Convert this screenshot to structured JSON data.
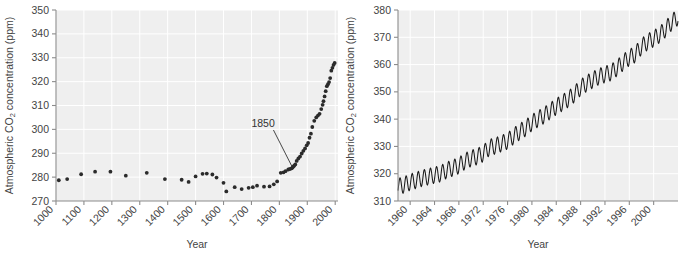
{
  "figure": {
    "name": "atmospheric-co2-concentration-figure",
    "background_color": "#ffffff",
    "plot_background_color": "#efefef",
    "gridline_color": "#ffffff",
    "axis_color": "#8c8c8c",
    "marker_color": "#2b2b2b",
    "line_color": "#1a1a1a",
    "text_color": "#444444"
  },
  "chart_data": [
    {
      "id": "left",
      "type": "scatter",
      "title": "",
      "xlabel": "Year",
      "ylabel": "Atmospheric CO2 concentration (ppm)",
      "ylabel_parts": {
        "pre": "Atmospheric CO",
        "sub": "2",
        "post": " concentration (ppm)"
      },
      "xlim": [
        1000,
        2010
      ],
      "ylim": [
        270,
        350
      ],
      "xticks": [
        1000,
        1100,
        1200,
        1300,
        1400,
        1500,
        1600,
        1700,
        1800,
        1900,
        2000
      ],
      "xtick_labels": [
        "1000",
        "1100",
        "1200",
        "1300",
        "1400",
        "1500",
        "1600",
        "1700",
        "1800",
        "1900",
        "2000"
      ],
      "xtick_label_rotation": -45,
      "yticks": [
        270,
        280,
        290,
        300,
        310,
        320,
        330,
        340,
        350
      ],
      "ytick_labels": [
        "270",
        "280",
        "290",
        "300",
        "310",
        "320",
        "330",
        "340",
        "350"
      ],
      "grid": true,
      "legend": "none",
      "annotations": [
        {
          "text": "1850",
          "label_x": 1700,
          "label_y": 301,
          "point_x": 1845,
          "point_y": 284.5
        }
      ],
      "x": [
        1010,
        1040,
        1090,
        1140,
        1195,
        1250,
        1325,
        1390,
        1450,
        1475,
        1500,
        1525,
        1540,
        1560,
        1575,
        1600,
        1610,
        1640,
        1665,
        1690,
        1705,
        1720,
        1745,
        1765,
        1780,
        1792,
        1805,
        1815,
        1822,
        1832,
        1838,
        1844,
        1847,
        1850,
        1853,
        1857,
        1862,
        1868,
        1874,
        1880,
        1886,
        1892,
        1898,
        1903,
        1908,
        1913,
        1918,
        1925,
        1932,
        1938,
        1944,
        1950,
        1955,
        1958,
        1962,
        1966,
        1970,
        1974,
        1978,
        1982,
        1986,
        1990,
        1994,
        1998
      ],
      "y": [
        278.7,
        279.2,
        281.2,
        282.3,
        282.3,
        280.6,
        281.8,
        279.2,
        278.9,
        278.0,
        280.3,
        281.4,
        281.5,
        281.1,
        279.8,
        277.6,
        274.0,
        275.8,
        275.0,
        275.5,
        275.8,
        276.4,
        276.0,
        276.1,
        277.0,
        278.2,
        281.8,
        282.0,
        282.5,
        283.2,
        283.4,
        283.7,
        284.0,
        284.4,
        284.8,
        285.3,
        286.8,
        287.8,
        288.6,
        289.9,
        291.0,
        292.0,
        293.3,
        294.3,
        296.5,
        298.2,
        301.0,
        303.6,
        305.0,
        305.8,
        306.5,
        308.5,
        310.3,
        311.8,
        313.8,
        316.0,
        318.1,
        318.9,
        319.8,
        321.5,
        324.6,
        325.8,
        327.0,
        327.8
      ]
    },
    {
      "id": "right",
      "type": "line",
      "title": "",
      "xlabel": "Year",
      "ylabel": "Atmospheric CO2 concentration (ppm)",
      "ylabel_parts": {
        "pre": "Atmospheric CO",
        "sub": "2",
        "post": " concentration (ppm)"
      },
      "xlim": [
        1958.0,
        2004.0
      ],
      "ylim": [
        310,
        380
      ],
      "xticks": [
        1960,
        1964,
        1968,
        1972,
        1976,
        1980,
        1984,
        1988,
        1992,
        1996,
        2000
      ],
      "xtick_labels": [
        "1960",
        "1964",
        "1968",
        "1972",
        "1976",
        "1980",
        "1984",
        "1988",
        "1992",
        "1996",
        "2000"
      ],
      "xtick_label_rotation": -45,
      "yticks": [
        310,
        320,
        330,
        340,
        350,
        360,
        370,
        380
      ],
      "ytick_labels": [
        "310",
        "320",
        "330",
        "340",
        "350",
        "360",
        "370",
        "380"
      ],
      "grid": true,
      "legend": "none",
      "series_name": "Mauna Loa monthly mean CO2",
      "seasonal_amplitude_ppm": 3.0,
      "annual_means": {
        "years": [
          1958,
          1959,
          1960,
          1961,
          1962,
          1963,
          1964,
          1965,
          1966,
          1967,
          1968,
          1969,
          1970,
          1971,
          1972,
          1973,
          1974,
          1975,
          1976,
          1977,
          1978,
          1979,
          1980,
          1981,
          1982,
          1983,
          1984,
          1985,
          1986,
          1987,
          1988,
          1989,
          1990,
          1991,
          1992,
          1993,
          1994,
          1995,
          1996,
          1997,
          1998,
          1999,
          2000,
          2001,
          2002,
          2003,
          2004
        ],
        "values": [
          315.3,
          315.9,
          316.9,
          317.6,
          318.4,
          318.9,
          319.5,
          320.0,
          321.3,
          322.1,
          323.0,
          324.6,
          325.6,
          326.3,
          327.4,
          329.6,
          330.2,
          331.1,
          332.0,
          333.8,
          335.4,
          336.8,
          338.7,
          340.1,
          341.4,
          343.0,
          344.6,
          346.0,
          347.4,
          349.2,
          351.6,
          353.1,
          354.4,
          355.6,
          356.4,
          357.1,
          358.8,
          360.8,
          362.6,
          363.8,
          366.6,
          368.3,
          369.5,
          371.0,
          373.1,
          375.6,
          377.4
        ]
      }
    }
  ]
}
